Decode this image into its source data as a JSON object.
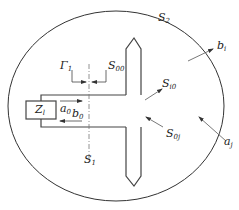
{
  "diagram": {
    "type": "waveguide antenna scattering schematic",
    "stroke_color": "#333333",
    "labels": {
      "S2": {
        "base": "S",
        "sub": "2"
      },
      "Gamma1": {
        "base": "Γ",
        "sub": "1"
      },
      "S00": {
        "base": "S",
        "sub": "00"
      },
      "Zl": {
        "base": "Z",
        "sub": "l"
      },
      "a0": {
        "base": "a",
        "sub": "0"
      },
      "b0": {
        "base": "b",
        "sub": "0"
      },
      "S1": {
        "base": "S",
        "sub": "1"
      },
      "Si0": {
        "base": "S",
        "sub": "i0"
      },
      "S0j": {
        "base": "S",
        "sub": "0j"
      },
      "bi": {
        "base": "b",
        "sub": "i"
      },
      "aj": {
        "base": "a",
        "sub": "j"
      }
    }
  }
}
